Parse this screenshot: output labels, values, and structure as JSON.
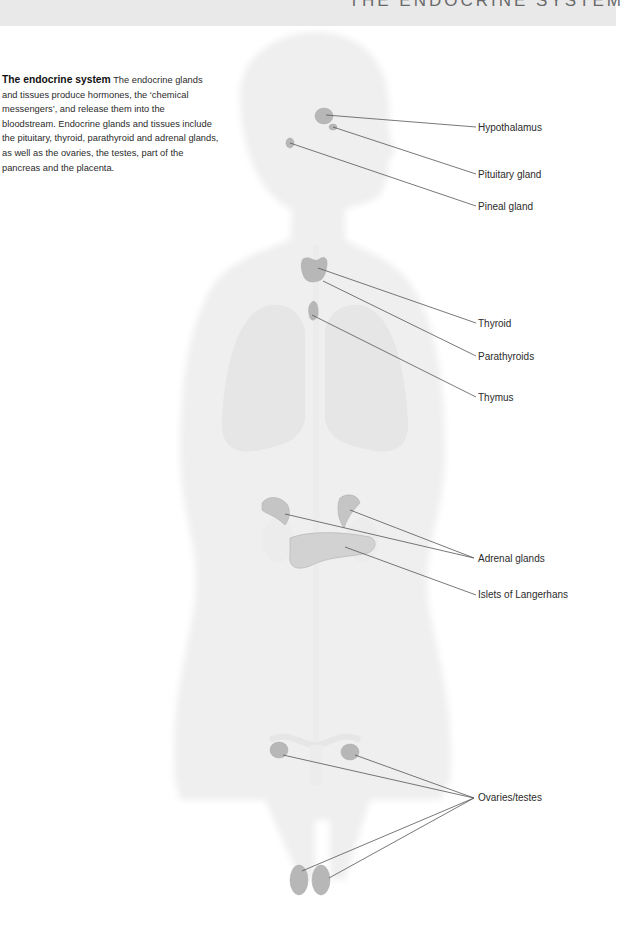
{
  "header": {
    "title": "THE ENDOCRINE SYSTEM"
  },
  "intro": {
    "heading": "The endocrine system",
    "body": "The endocrine glands and tissues produce hormones, the ‘chemical messengers’, and release them into the bloodstream. Endocrine glands and tissues include the pituitary, thyroid, parathyroid and adrenal glands, as well as the ovaries, the testes, part of the pancreas and the placenta."
  },
  "labels": [
    {
      "id": "hypothalamus",
      "text": "Hypothalamus",
      "x": 478,
      "y": 122
    },
    {
      "id": "pituitary",
      "text": "Pituitary gland",
      "x": 478,
      "y": 170
    },
    {
      "id": "pineal",
      "text": "Pineal gland",
      "x": 478,
      "y": 202
    },
    {
      "id": "thyroid",
      "text": "Thyroid",
      "x": 478,
      "y": 318
    },
    {
      "id": "parathyroids",
      "text": "Parathyroids",
      "x": 478,
      "y": 351
    },
    {
      "id": "thymus",
      "text": "Thymus",
      "x": 478,
      "y": 392
    },
    {
      "id": "adrenal",
      "text": "Adrenal glands",
      "x": 478,
      "y": 554
    },
    {
      "id": "islets",
      "text": "Islets of Langerhans",
      "x": 478,
      "y": 590
    },
    {
      "id": "ovaries",
      "text": "Ovaries/testes",
      "x": 478,
      "y": 792
    }
  ],
  "colors": {
    "gland": "#b9b9b9",
    "body": "#ececec",
    "line": "#555555",
    "text": "#2b2b2b"
  }
}
